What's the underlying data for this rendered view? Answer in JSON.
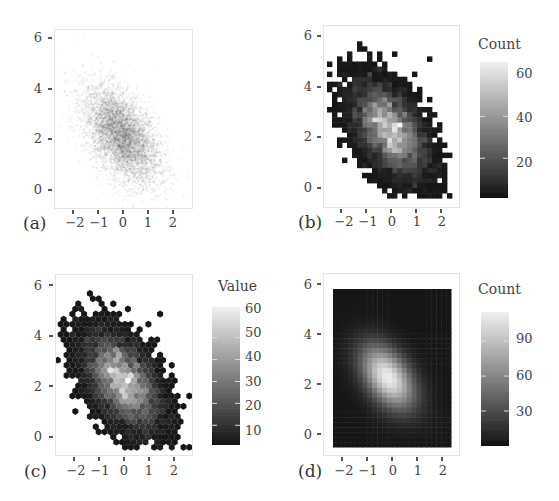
{
  "chart_data": [
    {
      "id": "a",
      "panel_label": "(a)",
      "type": "scatter",
      "description": "Scatter plot with transparent points (alpha blending) of a bivariate normal sample",
      "xlabel": "",
      "ylabel": "",
      "xticks": [
        -2,
        -1,
        0,
        1,
        2
      ],
      "yticks": [
        0,
        2,
        4,
        6
      ],
      "xticklabels": [
        "−2",
        "−1",
        "0",
        "1",
        "2"
      ],
      "yticklabels": [
        "0",
        "2",
        "4",
        "6"
      ],
      "xlim": [
        -2.8,
        2.8
      ],
      "ylim": [
        -0.8,
        6.2
      ],
      "distribution": {
        "mean_x": -0.1,
        "mean_y": 2.2,
        "sd_x": 0.75,
        "sd_y": 0.95,
        "rho": -0.5
      },
      "legend": null
    },
    {
      "id": "b",
      "panel_label": "(b)",
      "type": "heatmap",
      "description": "2D rectangular bin counts (geom_bin2d)",
      "xticks": [
        -2,
        -1,
        0,
        1,
        2
      ],
      "yticks": [
        0,
        2,
        4,
        6
      ],
      "xticklabels": [
        "−2",
        "−1",
        "0",
        "1",
        "2"
      ],
      "yticklabels": [
        "0",
        "2",
        "4",
        "6"
      ],
      "xlim": [
        -2.8,
        2.6
      ],
      "ylim": [
        -0.5,
        6.3
      ],
      "colorbar": {
        "title": "Count",
        "ticks": [
          20,
          40,
          60
        ],
        "range": [
          1,
          66
        ]
      },
      "distribution": {
        "mean_x": -0.1,
        "mean_y": 2.3,
        "sd_x": 0.8,
        "sd_y": 1.0,
        "rho": -0.5
      }
    },
    {
      "id": "c",
      "panel_label": "(c)",
      "type": "heatmap",
      "description": "Hexagonal bin counts (hexbin)",
      "xticks": [
        -2,
        -1,
        0,
        1,
        2
      ],
      "yticks": [
        0,
        2,
        4,
        6
      ],
      "xticklabels": [
        "−2",
        "−1",
        "0",
        "1",
        "2"
      ],
      "yticklabels": [
        "0",
        "2",
        "4",
        "6"
      ],
      "xlim": [
        -2.8,
        2.8
      ],
      "ylim": [
        -0.8,
        6.3
      ],
      "colorbar": {
        "title": "Value",
        "ticks": [
          10,
          20,
          30,
          40,
          50,
          60
        ],
        "range": [
          1,
          64
        ]
      },
      "distribution": {
        "mean_x": -0.1,
        "mean_y": 2.2,
        "sd_x": 0.8,
        "sd_y": 1.0,
        "rho": -0.5
      }
    },
    {
      "id": "d",
      "panel_label": "(d)",
      "type": "heatmap",
      "description": "Smoothed 2D density raster (counts)",
      "xticks": [
        -2,
        -1,
        0,
        1,
        2
      ],
      "yticks": [
        0,
        2,
        4,
        6
      ],
      "xticklabels": [
        "−2",
        "−1",
        "0",
        "1",
        "2"
      ],
      "yticklabels": [
        "0",
        "2",
        "4",
        "6"
      ],
      "xlim": [
        -2.8,
        2.6
      ],
      "ylim": [
        -0.8,
        6.3
      ],
      "colorbar": {
        "title": "Count",
        "ticks": [
          30,
          60,
          90
        ],
        "range": [
          0,
          115
        ]
      },
      "distribution": {
        "mean_x": -0.2,
        "mean_y": 2.3,
        "sd_x": 0.8,
        "sd_y": 0.95,
        "rho": -0.45
      }
    }
  ],
  "colors": {
    "low": "#141414",
    "high": "#f4f4f4",
    "point": "#1a1a1a",
    "frame": "#e4e4e4",
    "text": "#444444"
  }
}
